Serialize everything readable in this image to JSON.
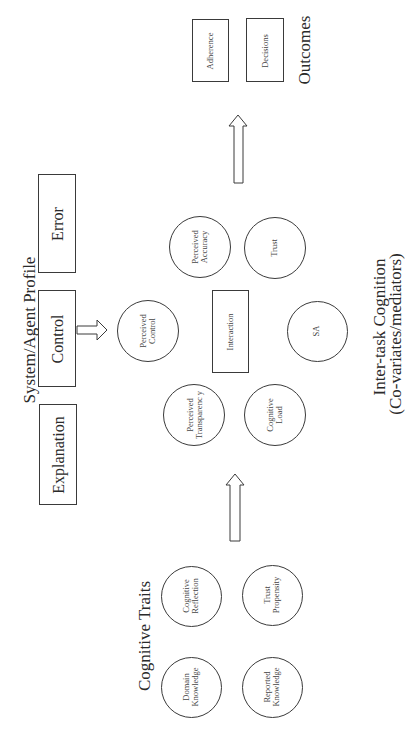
{
  "groups": {
    "system_profile": {
      "title": "System/Agent Profile",
      "boxes": [
        "Error",
        "Control",
        "Explanation"
      ]
    },
    "inter_task": {
      "title_line1": "Inter-task Cognition",
      "title_line2": "(Co-variates/mediators)",
      "center_box": "Interaction",
      "circles": [
        {
          "line1": "Perceived",
          "line2": "Control"
        },
        {
          "line1": "Perceived",
          "line2": "Accuracy"
        },
        {
          "line1": "Perceived",
          "line2": "Transparenc y"
        },
        {
          "line1": "Trust",
          "line2": ""
        },
        {
          "line1": "SA",
          "line2": ""
        },
        {
          "line1": "Cognitive",
          "line2": "Load"
        }
      ]
    },
    "cognitive_traits": {
      "title": "Cognitive Traits",
      "circles": [
        {
          "line1": "Cognitive",
          "line2": "Reflection"
        },
        {
          "line1": "Domain",
          "line2": "Knowledge"
        },
        {
          "line1": "Trust",
          "line2": "Propensity"
        },
        {
          "line1": "Reported",
          "line2": "Knowledge"
        }
      ]
    },
    "outcomes": {
      "title": "Outcomes",
      "boxes": [
        "Adherence",
        "Decisions"
      ]
    }
  },
  "colors": {
    "stroke": "#3a3a3a",
    "text": "#2a2a2a",
    "background": "#ffffff"
  }
}
